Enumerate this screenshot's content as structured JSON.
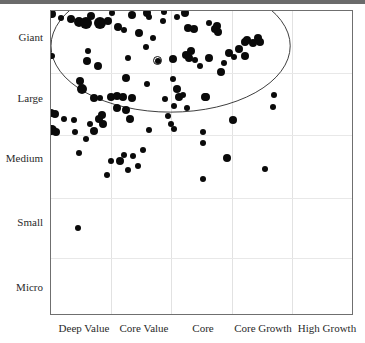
{
  "chart_data": {
    "type": "scatter",
    "title": "",
    "subtitle": "",
    "xlabel": "",
    "ylabel": "",
    "grid": true,
    "legend_position": "none",
    "xtick_labels": [
      "Deep Value",
      "Core Value",
      "Core",
      "Core Growth",
      "High Growth"
    ],
    "ytick_labels": [
      "Giant",
      "Large",
      "Medium",
      "Small",
      "Micro"
    ],
    "x_categories": [
      "Deep Value",
      "Core Value",
      "Core",
      "Core Growth",
      "High Growth"
    ],
    "y_categories": [
      "Giant",
      "Large",
      "Medium",
      "Small",
      "Micro"
    ],
    "xlim": [
      0,
      5
    ],
    "ylim": [
      0,
      5
    ],
    "annotations": [
      {
        "name": "portfolio-centroid-marker",
        "style": "circled-dot",
        "x": 1.77,
        "y": 4.18
      },
      {
        "name": "holdings-concentration-ellipse",
        "style": "ellipse-outline",
        "cx": 2.0,
        "cy": 4.42,
        "rx": 2.0,
        "ry": 1.1
      }
    ],
    "series": [
      {
        "name": "Holdings",
        "marker": "filled-circle",
        "color": "#0a0a0a",
        "points": [
          {
            "x": 0.02,
            "y": 4.95,
            "size": 4
          },
          {
            "x": 0.17,
            "y": 4.88,
            "size": 3
          },
          {
            "x": 0.34,
            "y": 4.86,
            "size": 4
          },
          {
            "x": 0.47,
            "y": 4.82,
            "size": 5
          },
          {
            "x": 0.58,
            "y": 4.8,
            "size": 6
          },
          {
            "x": 0.66,
            "y": 4.92,
            "size": 4
          },
          {
            "x": 0.82,
            "y": 4.8,
            "size": 6
          },
          {
            "x": 0.95,
            "y": 4.84,
            "size": 4
          },
          {
            "x": 1.02,
            "y": 4.96,
            "size": 3
          },
          {
            "x": 1.12,
            "y": 4.73,
            "size": 4
          },
          {
            "x": 1.21,
            "y": 4.69,
            "size": 3
          },
          {
            "x": 1.35,
            "y": 4.93,
            "size": 4
          },
          {
            "x": 1.47,
            "y": 4.64,
            "size": 4
          },
          {
            "x": 1.6,
            "y": 4.97,
            "size": 4
          },
          {
            "x": 1.62,
            "y": 4.9,
            "size": 3
          },
          {
            "x": 1.69,
            "y": 4.55,
            "size": 3
          },
          {
            "x": 1.86,
            "y": 4.84,
            "size": 3
          },
          {
            "x": 1.88,
            "y": 4.98,
            "size": 3
          },
          {
            "x": 2.1,
            "y": 4.9,
            "size": 3
          },
          {
            "x": 2.22,
            "y": 4.96,
            "size": 4
          },
          {
            "x": 2.27,
            "y": 4.72,
            "size": 4
          },
          {
            "x": 2.37,
            "y": 4.7,
            "size": 4
          },
          {
            "x": 2.63,
            "y": 4.81,
            "size": 3
          },
          {
            "x": 2.72,
            "y": 4.7,
            "size": 4
          },
          {
            "x": 2.76,
            "y": 4.75,
            "size": 4
          },
          {
            "x": 2.77,
            "y": 4.66,
            "size": 4
          },
          {
            "x": 3.22,
            "y": 4.49,
            "size": 4
          },
          {
            "x": 3.26,
            "y": 4.52,
            "size": 4
          },
          {
            "x": 3.35,
            "y": 4.47,
            "size": 4
          },
          {
            "x": 3.44,
            "y": 4.55,
            "size": 4
          },
          {
            "x": 3.47,
            "y": 4.49,
            "size": 4
          },
          {
            "x": 0.02,
            "y": 4.26,
            "size": 3
          },
          {
            "x": 0.62,
            "y": 4.34,
            "size": 3
          },
          {
            "x": 0.6,
            "y": 4.18,
            "size": 4
          },
          {
            "x": 0.78,
            "y": 4.1,
            "size": 4
          },
          {
            "x": 1.28,
            "y": 4.23,
            "size": 3
          },
          {
            "x": 1.58,
            "y": 4.4,
            "size": 3
          },
          {
            "x": 1.77,
            "y": 4.18,
            "size": 3
          },
          {
            "x": 2.02,
            "y": 4.2,
            "size": 4
          },
          {
            "x": 2.25,
            "y": 4.28,
            "size": 4
          },
          {
            "x": 2.3,
            "y": 4.23,
            "size": 4
          },
          {
            "x": 2.32,
            "y": 4.34,
            "size": 4
          },
          {
            "x": 2.4,
            "y": 4.19,
            "size": 3
          },
          {
            "x": 2.62,
            "y": 4.22,
            "size": 4
          },
          {
            "x": 2.88,
            "y": 4.14,
            "size": 3
          },
          {
            "x": 2.96,
            "y": 4.3,
            "size": 4
          },
          {
            "x": 3.04,
            "y": 4.24,
            "size": 3
          },
          {
            "x": 3.12,
            "y": 4.38,
            "size": 4
          },
          {
            "x": 3.22,
            "y": 4.26,
            "size": 4
          },
          {
            "x": 2.47,
            "y": 4.1,
            "size": 3
          },
          {
            "x": 2.83,
            "y": 4.0,
            "size": 4
          },
          {
            "x": 0.49,
            "y": 3.85,
            "size": 4
          },
          {
            "x": 0.51,
            "y": 3.72,
            "size": 5
          },
          {
            "x": 1.25,
            "y": 3.9,
            "size": 4
          },
          {
            "x": 1.6,
            "y": 3.8,
            "size": 3
          },
          {
            "x": 2.02,
            "y": 3.88,
            "size": 3
          },
          {
            "x": 2.1,
            "y": 3.72,
            "size": 4
          },
          {
            "x": 2.12,
            "y": 3.58,
            "size": 4
          },
          {
            "x": 2.05,
            "y": 3.44,
            "size": 3
          },
          {
            "x": 0.72,
            "y": 3.56,
            "size": 4
          },
          {
            "x": 0.81,
            "y": 3.56,
            "size": 3
          },
          {
            "x": 1.0,
            "y": 3.58,
            "size": 4
          },
          {
            "x": 1.1,
            "y": 3.6,
            "size": 4
          },
          {
            "x": 1.19,
            "y": 3.58,
            "size": 4
          },
          {
            "x": 1.34,
            "y": 3.56,
            "size": 4
          },
          {
            "x": 1.9,
            "y": 3.55,
            "size": 3
          },
          {
            "x": 2.2,
            "y": 3.62,
            "size": 3
          },
          {
            "x": 2.55,
            "y": 3.58,
            "size": 4
          },
          {
            "x": 2.58,
            "y": 3.58,
            "size": 4
          },
          {
            "x": 3.7,
            "y": 3.62,
            "size": 3
          },
          {
            "x": 1.1,
            "y": 3.4,
            "size": 4
          },
          {
            "x": 1.25,
            "y": 3.36,
            "size": 4
          },
          {
            "x": 2.26,
            "y": 3.4,
            "size": 3
          },
          {
            "x": 0.0,
            "y": 3.32,
            "size": 4
          },
          {
            "x": 0.06,
            "y": 3.3,
            "size": 4
          },
          {
            "x": 0.21,
            "y": 3.22,
            "size": 3
          },
          {
            "x": 0.38,
            "y": 3.2,
            "size": 3
          },
          {
            "x": 0.8,
            "y": 3.22,
            "size": 4
          },
          {
            "x": 0.84,
            "y": 3.28,
            "size": 4
          },
          {
            "x": 0.86,
            "y": 3.14,
            "size": 4
          },
          {
            "x": 0.64,
            "y": 3.14,
            "size": 3
          },
          {
            "x": 1.32,
            "y": 3.22,
            "size": 4
          },
          {
            "x": 1.95,
            "y": 3.26,
            "size": 3
          },
          {
            "x": 2.0,
            "y": 3.13,
            "size": 3
          },
          {
            "x": 3.02,
            "y": 3.2,
            "size": 4
          },
          {
            "x": 3.69,
            "y": 3.42,
            "size": 3
          },
          {
            "x": 0.02,
            "y": 3.03,
            "size": 5
          },
          {
            "x": 0.08,
            "y": 3.0,
            "size": 4
          },
          {
            "x": 0.4,
            "y": 3.01,
            "size": 3
          },
          {
            "x": 0.72,
            "y": 3.02,
            "size": 4
          },
          {
            "x": 1.63,
            "y": 3.03,
            "size": 3
          },
          {
            "x": 2.05,
            "y": 3.06,
            "size": 3
          },
          {
            "x": 2.52,
            "y": 3.0,
            "size": 3
          },
          {
            "x": 0.58,
            "y": 2.88,
            "size": 3
          },
          {
            "x": 2.52,
            "y": 2.82,
            "size": 3
          },
          {
            "x": 0.46,
            "y": 2.66,
            "size": 3
          },
          {
            "x": 1.52,
            "y": 2.7,
            "size": 3
          },
          {
            "x": 1.22,
            "y": 2.62,
            "size": 3
          },
          {
            "x": 1.36,
            "y": 2.6,
            "size": 3
          },
          {
            "x": 1.0,
            "y": 2.52,
            "size": 3
          },
          {
            "x": 1.14,
            "y": 2.52,
            "size": 4
          },
          {
            "x": 1.45,
            "y": 2.44,
            "size": 3
          },
          {
            "x": 1.28,
            "y": 2.38,
            "size": 3
          },
          {
            "x": 0.93,
            "y": 2.3,
            "size": 3
          },
          {
            "x": 3.56,
            "y": 2.4,
            "size": 3
          },
          {
            "x": 2.53,
            "y": 2.22,
            "size": 3
          },
          {
            "x": 2.92,
            "y": 2.58,
            "size": 4
          },
          {
            "x": 0.45,
            "y": 1.42,
            "size": 3
          }
        ]
      }
    ]
  },
  "axis": {
    "y_labels": [
      {
        "label": "Giant"
      },
      {
        "label": "Large"
      },
      {
        "label": "Medium"
      },
      {
        "label": "Small"
      },
      {
        "label": "Micro"
      }
    ],
    "x_labels": [
      {
        "label": "Deep Value"
      },
      {
        "label": "Core Value"
      },
      {
        "label": "Core"
      },
      {
        "label": "Core Growth"
      },
      {
        "label": "High Growth"
      }
    ]
  },
  "colors": {
    "marker": "#0a0a0a",
    "border": "#6f6f6f",
    "gridline": "#e4e4e4",
    "text": "#2a2a2a",
    "topband": "#6b6b6b"
  }
}
